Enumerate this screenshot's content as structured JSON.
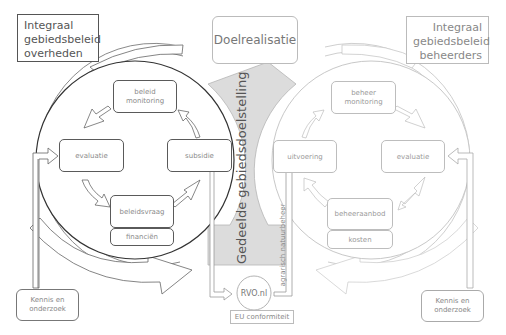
{
  "diagram": {
    "left_panel": {
      "title": "Integraal gebiedsbeleid overheden",
      "title_lines": [
        "Integraal",
        "gebiedsbeleid",
        "overheden"
      ],
      "nodes": {
        "top": "beleid monitoring",
        "left": "evaluatie",
        "right": "subsidie",
        "bottom": "beleidsvraag",
        "bottom_sub": "financiën"
      },
      "input_box": "Kennis en onderzoek"
    },
    "right_panel": {
      "title": "Integraal gebiedsbeleid beheerders",
      "title_lines": [
        "Integraal",
        "gebiedsbeleid",
        "beheerders"
      ],
      "nodes": {
        "top": "beheer monitoring",
        "left": "uitvoering",
        "right": "evaluatie",
        "bottom": "beheeraanbod",
        "bottom_sub": "kosten"
      },
      "input_box": "Kennis en onderzoek"
    },
    "center": {
      "goal": "Doelrealisatie",
      "shared_goal": "Gedeelde gebiedsdoelstelling",
      "agency": "RVO.nl",
      "compliance": "EU conformiteit",
      "vertical_label": "agrarisch natuurbeheer"
    },
    "colors": {
      "dark_stroke": "#555555",
      "light_stroke": "#c4c4c4",
      "shared_fill": "#dcdcdc"
    }
  }
}
